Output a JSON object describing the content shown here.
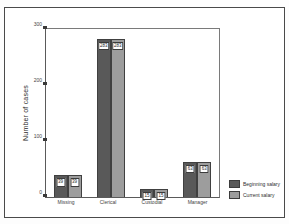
{
  "figure": {
    "top_strip_text": "",
    "background_color": "#ffffff",
    "frame_color": "#4a4a4a"
  },
  "axes": {
    "y_title": "Number of cases",
    "y_ticks": [
      "0",
      "100",
      "200",
      "300"
    ],
    "x_labels": [
      "Missing",
      "Clerical",
      "Custodial",
      "Manager"
    ]
  },
  "legend": {
    "position": "right",
    "entries": [
      {
        "label": "Beginning salary",
        "color": "#595959"
      },
      {
        "label": "Current salary",
        "color": "#9d9d9d"
      }
    ]
  },
  "chart_data": {
    "type": "bar",
    "title": "",
    "subtitle": "",
    "xlabel": "",
    "ylabel": "Number of cases",
    "categories": [
      "Missing",
      "Clerical",
      "Custodial",
      "Manager"
    ],
    "series": [
      {
        "name": "Beginning salary",
        "color": "#595959",
        "values": [
          39,
          283,
          15,
          63
        ]
      },
      {
        "name": "Current salary",
        "color": "#9d9d9d",
        "values": [
          39,
          283,
          15,
          63
        ]
      }
    ],
    "value_labels": [
      [
        "39",
        "39"
      ],
      [
        "283",
        "283"
      ],
      [
        "15",
        "15"
      ],
      [
        "63",
        "63"
      ]
    ],
    "ylim": [
      0,
      300
    ],
    "yticks": [
      0,
      100,
      200,
      300
    ],
    "grid": false,
    "legend_position": "right",
    "grouped": true,
    "bar_gap": 0
  }
}
